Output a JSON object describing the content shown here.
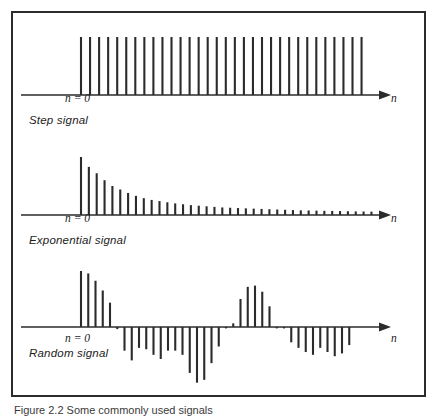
{
  "figure": {
    "caption": "Figure 2.2   Some commonly used signals",
    "frame_color": "#2b2b2b",
    "ink_color": "#2b2b2b",
    "background": "#ffffff"
  },
  "panels": [
    {
      "id": "step",
      "title": "Step signal",
      "origin_label": "n = 0",
      "axis_label": "n"
    },
    {
      "id": "exponential",
      "title": "Exponential signal",
      "origin_label": "n = 0",
      "axis_label": "n"
    },
    {
      "id": "random",
      "title": "Random signal",
      "origin_label": "n = 0",
      "axis_label": "n"
    }
  ],
  "chart_data": [
    {
      "type": "bar",
      "id": "step",
      "title": "Step signal",
      "xlabel": "n",
      "ylabel": "",
      "grid": false,
      "legend": "none",
      "axis_y_zero": true,
      "ylim": [
        0,
        1.05
      ],
      "x": [
        0,
        1,
        2,
        3,
        4,
        5,
        6,
        7,
        8,
        9,
        10,
        11,
        12,
        13,
        14,
        15,
        16,
        17,
        18,
        19,
        20,
        21,
        22,
        23,
        24,
        25,
        26,
        27,
        28,
        29,
        30,
        31
      ],
      "values": [
        1,
        1,
        1,
        1,
        1,
        1,
        1,
        1,
        1,
        1,
        1,
        1,
        1,
        1,
        1,
        1,
        1,
        1,
        1,
        1,
        1,
        1,
        1,
        1,
        1,
        1,
        1,
        1,
        1,
        1,
        1,
        1
      ]
    },
    {
      "type": "bar",
      "id": "exponential",
      "title": "Exponential signal",
      "xlabel": "n",
      "ylabel": "",
      "grid": false,
      "legend": "none",
      "axis_y_zero": true,
      "ylim": [
        0,
        1.05
      ],
      "x": [
        0,
        1,
        2,
        3,
        4,
        5,
        6,
        7,
        8,
        9,
        10,
        11,
        12,
        13,
        14,
        15,
        16,
        17,
        18,
        19,
        20,
        21,
        22,
        23,
        24,
        25,
        26,
        27,
        28,
        29,
        30,
        31,
        32,
        33,
        34,
        35,
        36,
        37
      ],
      "values": [
        1.0,
        0.83,
        0.72,
        0.6,
        0.5,
        0.44,
        0.38,
        0.33,
        0.29,
        0.26,
        0.24,
        0.22,
        0.2,
        0.185,
        0.17,
        0.16,
        0.15,
        0.14,
        0.13,
        0.125,
        0.12,
        0.115,
        0.11,
        0.105,
        0.1,
        0.095,
        0.09,
        0.085,
        0.08,
        0.078,
        0.075,
        0.072,
        0.07,
        0.068,
        0.065,
        0.062,
        0.06,
        0.058
      ]
    },
    {
      "type": "bar",
      "id": "random",
      "title": "Random signal",
      "xlabel": "n",
      "ylabel": "",
      "grid": false,
      "legend": "none",
      "axis_y_zero": true,
      "ylim": [
        -1.0,
        1.0
      ],
      "x": [
        0,
        1,
        2,
        3,
        4,
        5,
        6,
        7,
        8,
        9,
        10,
        11,
        12,
        13,
        14,
        15,
        16,
        17,
        18,
        19,
        20,
        21,
        22,
        23,
        24,
        25,
        26,
        27,
        28,
        29,
        30,
        31,
        32,
        33,
        34,
        35,
        36,
        37,
        38,
        39,
        40
      ],
      "values": [
        0.92,
        0.88,
        0.76,
        0.6,
        0.4,
        -0.03,
        -0.34,
        -0.48,
        -0.3,
        -0.32,
        -0.4,
        -0.46,
        -0.34,
        -0.34,
        -0.4,
        -0.66,
        -0.8,
        -0.76,
        -0.52,
        -0.28,
        -0.02,
        0.06,
        0.46,
        0.66,
        0.68,
        0.58,
        0.34,
        -0.02,
        -0.02,
        -0.22,
        -0.3,
        -0.36,
        -0.4,
        -0.3,
        -0.36,
        -0.42,
        -0.38,
        -0.26,
        0,
        0,
        0
      ]
    }
  ]
}
